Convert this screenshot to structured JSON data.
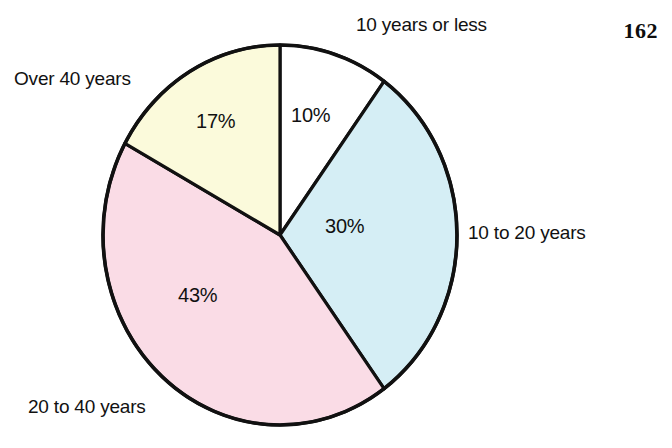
{
  "page": {
    "folio": "162",
    "background_color": "#ffffff",
    "ink_color": "#111111"
  },
  "chart_data": {
    "type": "pie",
    "title": "",
    "subtitle": "",
    "xlabel": "",
    "ylabel": "",
    "legend_position": "callout-labels-around-pie",
    "grid": false,
    "start_angle_deg": 0,
    "direction": "clockwise",
    "units": "percent",
    "total": 100,
    "categories": [
      "10 years or less",
      "10 to 20 years",
      "20 to 40 years",
      "Over 40 years"
    ],
    "values": [
      10,
      30,
      43,
      17
    ],
    "value_labels": [
      "10%",
      "30%",
      "43%",
      "17%"
    ],
    "colors": [
      "#ffffff",
      "#d5eef5",
      "#fadce6",
      "#fbfadb"
    ],
    "slices": [
      {
        "label": "10 years or less",
        "value": 10,
        "value_label": "10%",
        "color": "#ffffff",
        "start_deg": 0,
        "end_deg": 36
      },
      {
        "label": "10 to 20 years",
        "value": 30,
        "value_label": "30%",
        "color": "#d5eef5",
        "start_deg": 36,
        "end_deg": 144
      },
      {
        "label": "20 to 40 years",
        "value": 43,
        "value_label": "43%",
        "color": "#fadce6",
        "start_deg": 144,
        "end_deg": 298.8
      },
      {
        "label": "Over 40 years",
        "value": 17,
        "value_label": "17%",
        "color": "#fbfadb",
        "start_deg": 298.8,
        "end_deg": 360
      }
    ]
  },
  "labels": {
    "over_40_years": "Over 40 years",
    "ten_years_or_less": "10 years or less",
    "ten_to_20_years": "10 to 20 years",
    "twenty_to_40_years": "20 to 40 years",
    "pct_10": "10%",
    "pct_30": "30%",
    "pct_43": "43%",
    "pct_17": "17%"
  }
}
